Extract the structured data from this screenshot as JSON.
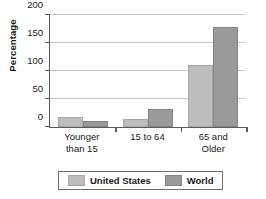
{
  "chart_data": {
    "type": "bar",
    "title": "",
    "xlabel": "",
    "ylabel": "Percentage",
    "ylim": [
      0,
      200
    ],
    "yticks": [
      0,
      50,
      100,
      150,
      200
    ],
    "ytick_labels": [
      "0",
      "50",
      "100",
      "150",
      "200"
    ],
    "grid": true,
    "legend_position": "bottom",
    "categories": [
      "Younger than 15",
      "15 to 64",
      "65 and Older"
    ],
    "category_lines": [
      [
        "Younger",
        "than 15"
      ],
      [
        "15 to 64"
      ],
      [
        "65 and",
        "Older"
      ]
    ],
    "series": [
      {
        "name": "United States",
        "color": "#bdbdbd",
        "values": [
          17,
          15,
          110
        ]
      },
      {
        "name": "World",
        "color": "#9a9a9a",
        "values": [
          10,
          32,
          178
        ]
      }
    ]
  },
  "legend": {
    "items": [
      {
        "label": "United States",
        "swatch": "legend-swatch-united-states"
      },
      {
        "label": "World",
        "swatch": "legend-swatch-world"
      }
    ]
  },
  "axis": {
    "y_title": "Percentage"
  }
}
